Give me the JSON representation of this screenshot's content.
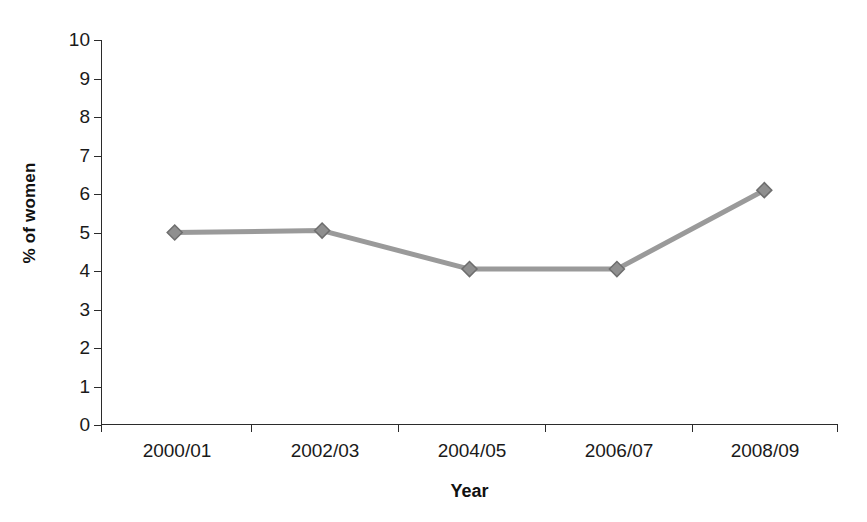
{
  "chart_data": {
    "type": "line",
    "title": "",
    "xlabel": "Year",
    "ylabel": "% of women",
    "categories": [
      "2000/01",
      "2002/03",
      "2004/05",
      "2006/07",
      "2008/09"
    ],
    "values": [
      5.0,
      5.05,
      4.05,
      4.05,
      6.1
    ],
    "series": [
      {
        "name": "% of women",
        "values": [
          5.0,
          5.05,
          4.05,
          4.05,
          6.1
        ]
      }
    ],
    "ylim": [
      0,
      10
    ],
    "ytick_labels": [
      "10",
      "9",
      "8",
      "7",
      "6",
      "5",
      "4",
      "3",
      "2",
      "1",
      "0"
    ],
    "ytick_values": [
      10,
      9,
      8,
      7,
      6,
      5,
      4,
      3,
      2,
      1,
      0
    ],
    "grid": false,
    "legend": "none",
    "marker": "diamond",
    "colors": {
      "line": "#9a9a9a",
      "marker_fill": "#8f8f8f",
      "marker_edge": "#6e6e6e",
      "axis": "#2b2b2b",
      "text": "#1a1a1a",
      "background": "#ffffff"
    }
  }
}
